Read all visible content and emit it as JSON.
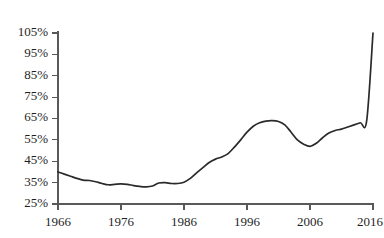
{
  "title_fragment": "(…in 2016)",
  "chart_data": {
    "type": "line",
    "title": "(…in 2016)",
    "xlabel": "",
    "ylabel": "",
    "xlim": [
      1966,
      2016
    ],
    "ylim": [
      25,
      105
    ],
    "grid": false,
    "legend": null,
    "line_color": "#2a2a2a",
    "axis_color": "#595959",
    "y_ticks": [
      25,
      35,
      45,
      55,
      65,
      75,
      85,
      95,
      105
    ],
    "y_tick_labels": [
      "25%",
      "35%",
      "45%",
      "55%",
      "65%",
      "75%",
      "85%",
      "95%",
      "105%"
    ],
    "x_ticks": [
      1966,
      1976,
      1986,
      1996,
      2006,
      2016
    ],
    "x_tick_labels": [
      "1966",
      "1976",
      "1986",
      "1996",
      "2006",
      "2016"
    ],
    "series": [
      {
        "name": "value",
        "x": [
          1966,
          1967,
          1968,
          1969,
          1970,
          1971,
          1972,
          1973,
          1974,
          1975,
          1976,
          1977,
          1978,
          1979,
          1980,
          1981,
          1982,
          1983,
          1984,
          1985,
          1986,
          1987,
          1988,
          1989,
          1990,
          1991,
          1992,
          1993,
          1994,
          1995,
          1996,
          1997,
          1998,
          1999,
          2000,
          2001,
          2002,
          2003,
          2004,
          2005,
          2006,
          2007,
          2008,
          2009,
          2010,
          2011,
          2012,
          2013,
          2014,
          2015,
          2016
        ],
        "values": [
          40.0,
          39.0,
          38.0,
          37.0,
          36.2,
          36.0,
          35.4,
          34.6,
          34.0,
          34.2,
          34.4,
          34.2,
          33.6,
          33.2,
          33.0,
          33.4,
          34.8,
          35.0,
          34.6,
          34.6,
          35.2,
          37.0,
          39.6,
          42.0,
          44.4,
          46.0,
          47.0,
          48.6,
          51.6,
          55.0,
          58.6,
          61.4,
          63.0,
          63.8,
          64.0,
          63.6,
          62.0,
          58.6,
          55.0,
          53.0,
          52.0,
          53.4,
          56.0,
          58.2,
          59.4,
          60.0,
          61.0,
          62.0,
          63.0,
          64.0,
          105.0
        ]
      }
    ],
    "annotations": []
  },
  "axes": {
    "y_axis_name": "y-axis",
    "x_axis_name": "x-axis"
  }
}
